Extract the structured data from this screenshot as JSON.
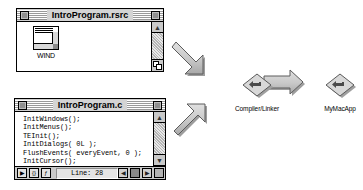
{
  "scene": {
    "title": "Mac build process diagram",
    "background_color": "#ffffff"
  },
  "resource_window": {
    "title": "IntroProgram.rsrc",
    "close_box_name": "close-box",
    "zoom_box_name": "zoom-box",
    "resources": [
      {
        "type_label": "WIND",
        "icon": "window-resource-icon"
      }
    ],
    "scrollbar": {
      "up_arrow": "▲",
      "down_arrow": "▼"
    }
  },
  "source_window": {
    "title": "IntroProgram.c",
    "code_lines": [
      "InitWindows();",
      "InitMenus();",
      "TEInit();",
      "InitDialogs( 0L );",
      "FlushEvents( everyEvent, 0 );",
      "InitCursor();"
    ],
    "status_bar": {
      "buttons": [
        {
          "name": "run-button",
          "glyph": "▶"
        },
        {
          "name": "marker-button",
          "glyph": "{}"
        },
        {
          "name": "function-button",
          "glyph": "ƒ"
        }
      ],
      "line_label": "Line: 28",
      "right_controls": [
        {
          "name": "scroll-left-button",
          "glyph": "◀"
        },
        {
          "name": "split-button",
          "glyph": "■"
        },
        {
          "name": "scroll-right-button",
          "glyph": "▶"
        },
        {
          "name": "grow-box",
          "glyph": ""
        }
      ]
    },
    "scrollbar": {
      "up_arrow": "▲",
      "down_arrow": "▼",
      "left_arrow": "◀",
      "right_arrow": "▶"
    }
  },
  "flow": {
    "merge_arrow_name": "merge-arrow",
    "output_arrow_name": "output-arrow",
    "colors": {
      "arrow_fill": "#c6c6c6",
      "arrow_stroke": "#4d4d4d",
      "arrow_shadow": "#9a9a9a",
      "icon_fill": "#dcdcdc",
      "icon_stroke": "#5a5a5a"
    }
  },
  "processes": [
    {
      "id": "compiler",
      "label": "Compiler/Linker",
      "icon": "diamond-app-icon"
    },
    {
      "id": "application",
      "label": "MyMacApp",
      "icon": "diamond-app-icon"
    }
  ]
}
